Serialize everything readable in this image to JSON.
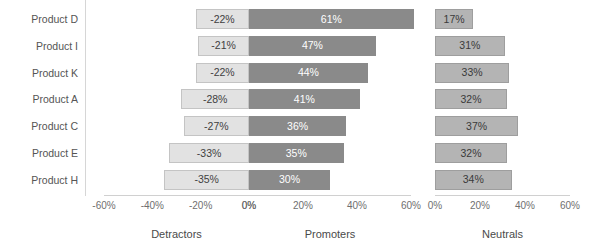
{
  "chart_data": {
    "type": "bar",
    "title": "",
    "subtitle": "",
    "xlabel": "",
    "ylabel": "",
    "grid": false,
    "legend_position": "none",
    "orientation": "horizontal",
    "categories": [
      "Product D",
      "Product I",
      "Product K",
      "Product A",
      "Product C",
      "Product E",
      "Product H"
    ],
    "panels": [
      {
        "name": "detractors",
        "axis_title": "Detractors",
        "ticks": [
          "-60%",
          "-40%",
          "-20%",
          "0%"
        ],
        "tick_values": [
          -60,
          -40,
          -20,
          0
        ],
        "xlim": [
          -60,
          0
        ],
        "series_name": "Detractors",
        "values": [
          -22,
          -21,
          -22,
          -28,
          -27,
          -33,
          -35
        ],
        "labels": [
          "-22%",
          "-21%",
          "-22%",
          "-28%",
          "-27%",
          "-33%",
          "-35%"
        ],
        "color": "#e2e2e2",
        "label_color": "#3f3f3f"
      },
      {
        "name": "promoters",
        "axis_title": "Promoters",
        "ticks": [
          "0%",
          "20%",
          "40%",
          "60%"
        ],
        "tick_values": [
          0,
          20,
          40,
          60
        ],
        "xlim": [
          0,
          60
        ],
        "series_name": "Promoters",
        "values": [
          61,
          47,
          44,
          41,
          36,
          35,
          30
        ],
        "labels": [
          "61%",
          "47%",
          "44%",
          "41%",
          "36%",
          "35%",
          "30%"
        ],
        "color": "#8a8a8a",
        "label_color": "#ffffff"
      },
      {
        "name": "neutrals",
        "axis_title": "Neutrals",
        "ticks": [
          "0%",
          "20%",
          "40%",
          "60%"
        ],
        "tick_values": [
          0,
          20,
          40,
          60
        ],
        "xlim": [
          0,
          60
        ],
        "series_name": "Neutrals",
        "values": [
          17,
          31,
          33,
          32,
          37,
          32,
          34
        ],
        "labels": [
          "17%",
          "31%",
          "33%",
          "32%",
          "37%",
          "32%",
          "34%"
        ],
        "color": "#b4b4b4",
        "label_color": "#3a3a3a"
      }
    ],
    "series": [
      {
        "name": "Detractors",
        "values": [
          -22,
          -21,
          -22,
          -28,
          -27,
          -33,
          -35
        ]
      },
      {
        "name": "Promoters",
        "values": [
          61,
          47,
          44,
          41,
          36,
          35,
          30
        ]
      },
      {
        "name": "Neutrals",
        "values": [
          17,
          31,
          33,
          32,
          37,
          32,
          34
        ]
      }
    ]
  }
}
